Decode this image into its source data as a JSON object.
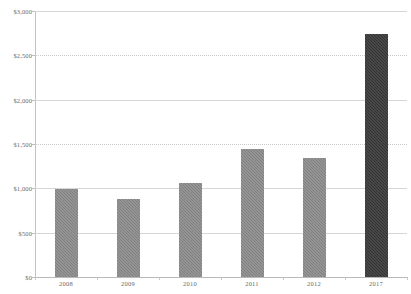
{
  "chart_data": {
    "type": "bar",
    "title": "",
    "subtitle": "",
    "xlabel": "",
    "ylabel": "",
    "categories": [
      "2008",
      "2009",
      "2010",
      "2011",
      "2012",
      "2017"
    ],
    "values": [
      990,
      880,
      1060,
      1445,
      1340,
      2745
    ],
    "series": [
      {
        "name": "",
        "values": [
          990,
          880,
          1060,
          1445,
          1340,
          2745
        ]
      }
    ],
    "ylim": [
      0,
      3000
    ],
    "y_ticks": [
      0,
      500,
      1000,
      1500,
      2000,
      2500,
      3000
    ],
    "y_tick_labels": [
      "$0",
      "$500",
      "$1,000",
      "$1,500",
      "$2,000",
      "$2,500",
      "$3,000"
    ],
    "grid": true,
    "grid_axis": "y",
    "legend": false,
    "legend_position": "none",
    "bar_colors": [
      "#808080",
      "#808080",
      "#808080",
      "#808080",
      "#808080",
      "#333333"
    ],
    "highlight_category": "2017",
    "colors": {
      "bar_default": "#808080",
      "bar_highlight": "#333333",
      "gridline": "#d6d6d6",
      "axis": "#c2c2c2",
      "tick_text": "#6a6a6a",
      "background": "#ffffff"
    }
  }
}
